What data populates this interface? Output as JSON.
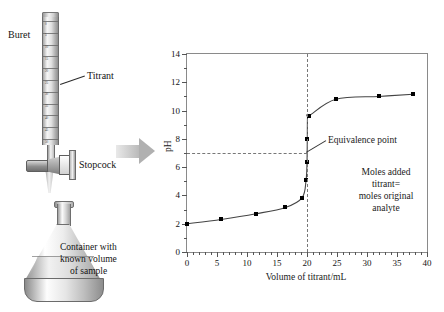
{
  "apparatus": {
    "labels": {
      "buret": "Buret",
      "titrant": "Titrant",
      "stopcock": "Stopcock",
      "container_line1": "Container with",
      "container_line2": "known volume",
      "container_line3": "of sample"
    },
    "buret_graduations": [
      "0",
      "5",
      "10",
      "15",
      "20",
      "25",
      "30",
      "35",
      "40",
      "45",
      "50"
    ],
    "arrow": "process-arrow-right"
  },
  "chart_data": {
    "type": "line",
    "title": "",
    "xlabel": "Volume of titrant/mL",
    "ylabel": "pH",
    "xlim": [
      0,
      40
    ],
    "ylim": [
      0,
      14
    ],
    "xticks": [
      0,
      5,
      10,
      15,
      20,
      25,
      30,
      35,
      40
    ],
    "yticks": [
      0,
      2,
      4,
      6,
      8,
      10,
      12,
      14
    ],
    "x_minor_step": 1,
    "y_minor_step": 1,
    "grid": false,
    "legend": null,
    "x": [
      0,
      5.7,
      11.5,
      16.4,
      19.2,
      19.85,
      20.0,
      20.05,
      20.1,
      20.4,
      24.8,
      32.0,
      37.7
    ],
    "y": [
      2.0,
      2.3,
      2.7,
      3.15,
      3.85,
      5.1,
      6.35,
      8.0,
      9.65,
      9.65,
      10.8,
      11.0,
      11.15
    ],
    "points": [
      {
        "x": 0,
        "y": 2.0
      },
      {
        "x": 5.7,
        "y": 2.3
      },
      {
        "x": 11.5,
        "y": 2.7
      },
      {
        "x": 16.4,
        "y": 3.15
      },
      {
        "x": 19.2,
        "y": 3.85
      },
      {
        "x": 19.9,
        "y": 5.1
      },
      {
        "x": 19.95,
        "y": 6.35
      },
      {
        "x": 20.05,
        "y": 8.0
      },
      {
        "x": 20.4,
        "y": 9.65
      },
      {
        "x": 24.8,
        "y": 10.8
      },
      {
        "x": 32.0,
        "y": 11.0
      },
      {
        "x": 37.7,
        "y": 11.15
      }
    ],
    "equivalence_point": {
      "x": 20,
      "y": 7,
      "label": "Equivalence point"
    },
    "annotations": [
      {
        "line1": "Moles added titrant=",
        "line2": "moles original analyte"
      }
    ]
  }
}
